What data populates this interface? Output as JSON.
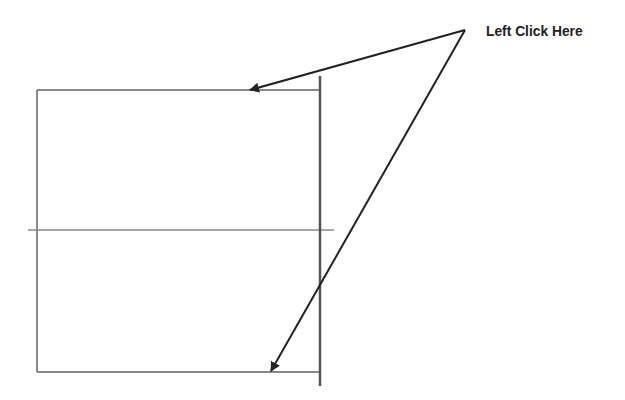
{
  "diagram": {
    "annotation": "Left Click Here",
    "colors": {
      "line": "#777777",
      "dark_line": "#555555",
      "arrow": "#222222",
      "background": "#ffffff"
    },
    "rectangle": {
      "left": 37,
      "top": 90,
      "right": 320,
      "bottom": 372
    },
    "center_line": {
      "y": 230,
      "x1": 28,
      "x2": 334
    },
    "vertical_line": {
      "x": 320,
      "y1": 76,
      "y2": 386
    },
    "arrows": [
      {
        "from": [
          465,
          30
        ],
        "to": [
          248,
          90
        ],
        "target": "top-edge"
      },
      {
        "from": [
          465,
          30
        ],
        "to": [
          270,
          372
        ],
        "target": "bottom-edge"
      }
    ]
  }
}
